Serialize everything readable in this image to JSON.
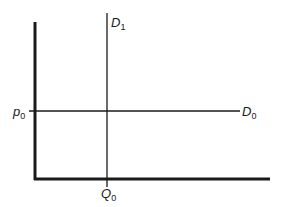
{
  "diagram": {
    "type": "supply-demand-style axes diagram",
    "axes": {
      "vertical_label": "p",
      "horizontal_label": "Q"
    },
    "lines": [
      {
        "id": "D1",
        "label_main": "D",
        "label_sub": "1",
        "orientation": "vertical",
        "description": "Perfectly inelastic demand curve at Q0"
      },
      {
        "id": "D0",
        "label_main": "D",
        "label_sub": "0",
        "orientation": "horizontal",
        "description": "Perfectly elastic demand curve at p0"
      }
    ],
    "ticks": [
      {
        "id": "p0",
        "label_main": "p",
        "label_sub": "0",
        "axis": "vertical"
      },
      {
        "id": "Q0",
        "label_main": "Q",
        "label_sub": "0",
        "axis": "horizontal"
      }
    ],
    "colors": {
      "line": "#1a1a1a",
      "background": "#ffffff"
    }
  }
}
